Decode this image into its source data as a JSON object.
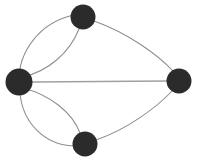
{
  "figure": {
    "title": "",
    "type": "graph-diagram",
    "background_color": "#ffffff",
    "width": 198,
    "height": 166
  },
  "style": {
    "node_color": "#2b2b2b",
    "edge_color": "#8d8d8d",
    "straight_edge_color": "#a0a0a0",
    "edge_width": 1.05
  },
  "graph_data": {
    "type": "graph",
    "directed": false,
    "multigraph": true,
    "node_count": 4,
    "edge_count": 7,
    "nodes": [
      {
        "id": "left",
        "label": "",
        "x": 19,
        "y": 82,
        "r": 13.5
      },
      {
        "id": "top",
        "label": "",
        "x": 83,
        "y": 17,
        "r": 12.5
      },
      {
        "id": "right",
        "label": "",
        "x": 179,
        "y": 81,
        "r": 12.5
      },
      {
        "id": "bottom",
        "label": "",
        "x": 85,
        "y": 144,
        "r": 12.5
      }
    ],
    "edges": [
      {
        "id": "e1",
        "source": "left",
        "target": "top",
        "style": "curved-outer",
        "path": "M 19 82 C 18 52 40 22 74 15"
      },
      {
        "id": "e2",
        "source": "left",
        "target": "top",
        "style": "curved-inner",
        "path": "M 22 77 C 48 72 70 52 79 29"
      },
      {
        "id": "e3",
        "source": "left",
        "target": "bottom",
        "style": "curved-outer",
        "path": "M 20 92 C 22 122 44 145 74 146"
      },
      {
        "id": "e4",
        "source": "left",
        "target": "bottom",
        "style": "curved-inner",
        "path": "M 23 88 C 50 95 72 112 80 133"
      },
      {
        "id": "e5",
        "source": "left",
        "target": "right",
        "style": "straight",
        "path": "M 32 82 L 167 81"
      },
      {
        "id": "e6",
        "source": "top",
        "target": "right",
        "style": "curved",
        "path": "M 94 21 C 128 33 158 55 173 71"
      },
      {
        "id": "e7",
        "source": "bottom",
        "target": "right",
        "style": "curved",
        "path": "M 96 140 C 128 129 157 107 172 91"
      }
    ]
  }
}
